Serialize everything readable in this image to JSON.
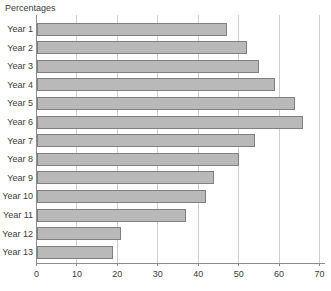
{
  "title": "Percentages",
  "colors": {
    "background": "#ffffff",
    "bar_fill": "#b9b9b9",
    "bar_border": "#7f7f7f",
    "gridline": "#cfcfcf",
    "axis": "#8c8c8c",
    "text": "#3c3c3c"
  },
  "chart_data": {
    "type": "bar",
    "orientation": "horizontal",
    "title": "Percentages",
    "categories": [
      "Year 1",
      "Year 2",
      "Year 3",
      "Year 4",
      "Year 5",
      "Year 6",
      "Year 7",
      "Year 8",
      "Year 9",
      "Year 10",
      "Year 11",
      "Year 12",
      "Year 13"
    ],
    "values": [
      47,
      52,
      55,
      59,
      64,
      66,
      54,
      50,
      44,
      42,
      37,
      21,
      19
    ],
    "xlabel": "",
    "ylabel": "",
    "xlim": [
      0,
      70
    ],
    "xticks": [
      0,
      10,
      20,
      30,
      40,
      50,
      60,
      70
    ],
    "grid": true,
    "legend": false
  }
}
